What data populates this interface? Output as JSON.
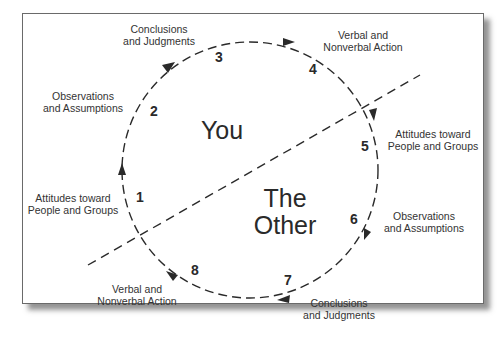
{
  "diagram": {
    "regions": {
      "you": "You",
      "other_line1": "The",
      "other_line2": "Other"
    },
    "steps": [
      {
        "number": "1",
        "label_line1": "Attitudes toward",
        "label_line2": "People and Groups"
      },
      {
        "number": "2",
        "label_line1": "Observations",
        "label_line2": "and Assumptions"
      },
      {
        "number": "3",
        "label_line1": "Conclusions",
        "label_line2": "and Judgments"
      },
      {
        "number": "4",
        "label_line1": "Verbal and",
        "label_line2": "Nonverbal Action"
      },
      {
        "number": "5",
        "label_line1": "Attitudes toward",
        "label_line2": "People and Groups"
      },
      {
        "number": "6",
        "label_line1": "Observations",
        "label_line2": "and Assumptions"
      },
      {
        "number": "7",
        "label_line1": "Conclusions",
        "label_line2": "and Judgments"
      },
      {
        "number": "8",
        "label_line1": "Verbal and",
        "label_line2": "Nonverbal Action"
      }
    ],
    "colors": {
      "line": "#2a2a2a",
      "frame_border": "#6a6a6a",
      "background": "#ffffff"
    }
  }
}
